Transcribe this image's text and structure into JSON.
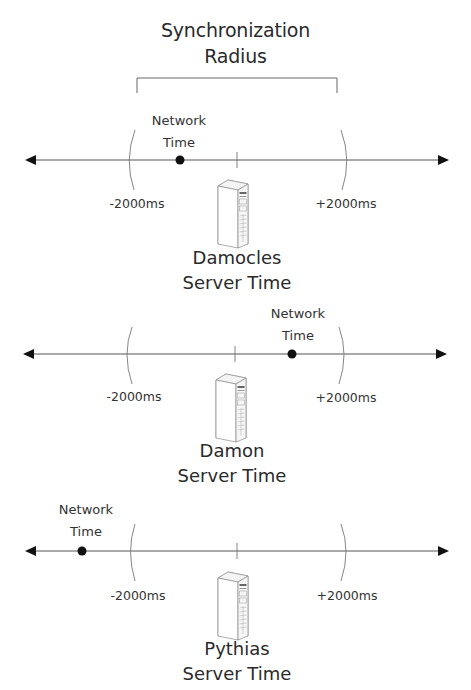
{
  "title": {
    "line1": "Synchronization",
    "line2": "Radius"
  },
  "timelines": [
    {
      "server_name": "Damocles",
      "server_suffix": "Server Time",
      "network_label_line1": "Network",
      "network_label_line2": "Time",
      "minus_label": "-2000ms",
      "plus_label": "+2000ms",
      "network_position": "inside-left"
    },
    {
      "server_name": "Damon",
      "server_suffix": "Server Time",
      "network_label_line1": "Network",
      "network_label_line2": "Time",
      "minus_label": "-2000ms",
      "plus_label": "+2000ms",
      "network_position": "inside-right"
    },
    {
      "server_name": "Pythias",
      "server_suffix": "Server Time",
      "network_label_line1": "Network",
      "network_label_line2": "Time",
      "minus_label": "-2000ms",
      "plus_label": "+2000ms",
      "network_position": "outside-left"
    }
  ],
  "icons": {
    "server": "server-tower-icon",
    "network_point": "filled-circle",
    "arrow": "triangle-arrowhead"
  },
  "colors": {
    "line": "#555555",
    "text": "#2a2a2a",
    "dot": "#111111"
  }
}
